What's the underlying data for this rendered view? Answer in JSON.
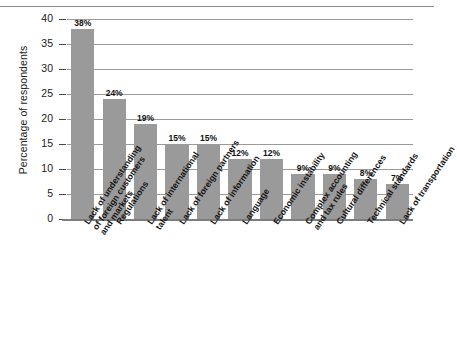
{
  "chart_data": {
    "type": "bar",
    "title": "",
    "xlabel": "",
    "ylabel": "Percentage of respondents",
    "ylim": [
      0,
      40
    ],
    "ytick_step": 5,
    "yticks": [
      "40",
      "35",
      "30",
      "25",
      "20",
      "15",
      "10",
      "5",
      "0"
    ],
    "grid": true,
    "legend": "none",
    "value_suffix": "%",
    "bar_color": "#9a9a9a",
    "categories": [
      "Lack of understanding of foreign customers and markets",
      "Regulations",
      "Lack of international talent",
      "Lack of foreign partners",
      "Lack of information",
      "Language",
      "Economic instability",
      "Complex accounting and tax rules",
      "Cultural differences",
      "Technical standards",
      "Lack of transportation"
    ],
    "category_lines": [
      [
        "Lack of understanding",
        "of foreign customers",
        "and markets"
      ],
      [
        "Regulations"
      ],
      [
        "Lack of international",
        "talent"
      ],
      [
        "Lack of foreign partners"
      ],
      [
        "Lack of information"
      ],
      [
        "Language"
      ],
      [
        "Economic instability"
      ],
      [
        "Complex accounting",
        "and tax rules"
      ],
      [
        "Cultural differences"
      ],
      [
        "Technical standards"
      ],
      [
        "Lack of transportation"
      ]
    ],
    "values": [
      38,
      24,
      19,
      15,
      15,
      12,
      12,
      9,
      9,
      8,
      7
    ],
    "value_labels": [
      "38%",
      "24%",
      "19%",
      "15%",
      "15%",
      "12%",
      "12%",
      "9%",
      "9%",
      "8%",
      "7%"
    ]
  }
}
